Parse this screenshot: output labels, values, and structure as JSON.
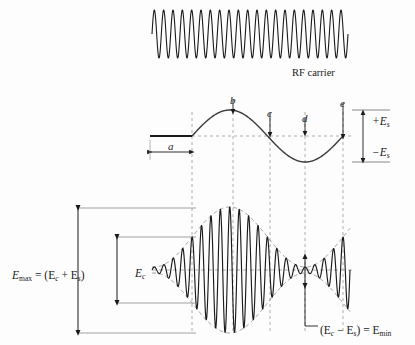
{
  "figure": {
    "title_implied": "AM modulation envelope diagram",
    "background_color": "#fdfdfd",
    "ink_color": "#1a1a1a",
    "guide_color": "#9a9a9a",
    "envelope_color": "#8c8c8c"
  },
  "carrier_panel": {
    "label": "RF carrier",
    "label_x": 292,
    "label_y": 68,
    "wave": {
      "x_start": 152,
      "x_end": 348,
      "y_center": 34,
      "amplitude": 24,
      "cycles": 21
    }
  },
  "modulating_panel": {
    "baseline_y": 136,
    "flat_x_start": 150,
    "flat_x_end": 192,
    "sine_x_start": 192,
    "sine_x_end": 343,
    "amplitude": 26,
    "cycles": 1,
    "dim_a": {
      "label": "a",
      "x_start": 150,
      "x_end": 192,
      "y": 152
    },
    "markers": [
      {
        "label": "b",
        "x": 233,
        "label_y": 95,
        "arrow_top": 100,
        "arrow_bottom": 112
      },
      {
        "label": "c",
        "x": 270,
        "label_y": 108,
        "arrow_top": 113,
        "arrow_bottom": 135
      },
      {
        "label": "d",
        "x": 305,
        "label_y": 113,
        "arrow_top": 118,
        "arrow_bottom": 134
      },
      {
        "label": "e",
        "x": 343,
        "label_y": 98,
        "arrow_top": 103,
        "arrow_bottom": 137
      }
    ],
    "amplitude_labels": [
      {
        "text": "+E",
        "sub": "s",
        "x": 372,
        "y": 116,
        "arrow_x": 363,
        "arrow_from": 136,
        "arrow_to": 112
      },
      {
        "text": "−E",
        "sub": "s",
        "x": 372,
        "y": 147,
        "arrow_x": 363,
        "arrow_from": 136,
        "arrow_to": 161
      }
    ],
    "level_ticks": [
      {
        "y": 110,
        "x_start": 352,
        "x_end": 390
      },
      {
        "y": 162,
        "x_start": 352,
        "x_end": 390
      }
    ]
  },
  "am_panel": {
    "x_start": 152,
    "x_end": 350,
    "center_y": 270,
    "carrier_amplitude": 33,
    "modulation_amplitude": 30,
    "carrier_cycles": 21,
    "envelope_phase_x_start": 192,
    "dimensions": [
      {
        "name": "E-max",
        "text": "E",
        "sub": "max",
        "suffix": " = (E",
        "sub2": "c",
        "suffix2": " + E",
        "sub3": "s",
        "suffix3": ")",
        "label_x": 12,
        "label_y": 270,
        "arrow_x": 78,
        "y_top": 208,
        "y_bottom": 333,
        "rule_top": {
          "x_start": 78,
          "x_end": 196,
          "y": 208
        },
        "rule_bottom": {
          "x_start": 78,
          "x_end": 196,
          "y": 333
        }
      },
      {
        "name": "E-c",
        "text": "E",
        "sub": "c",
        "label_x": 117,
        "label_y": 268,
        "arrow_x": 117,
        "y_top": 237,
        "y_bottom": 303,
        "rule_top": {
          "x_start": 117,
          "x_end": 196,
          "y": 237
        },
        "rule_bottom": {
          "x_start": 117,
          "x_end": 196,
          "y": 303
        }
      }
    ],
    "emin": {
      "arrow_x": 305,
      "y_top": 256,
      "y_bottom": 286,
      "leader_down_to": 326,
      "leader_x_end": 318,
      "label": "(E",
      "sub": "c",
      "mid": " − E",
      "sub2": "s",
      "tail": ") = E",
      "sub3": "min",
      "label_x": 320,
      "label_y": 325
    }
  },
  "guides": {
    "vertical_dashed_x": [
      192,
      233,
      270,
      305,
      343
    ],
    "y_top": 112,
    "y_bottom": 333,
    "baseline_dashed": {
      "y": 136,
      "x_start": 192,
      "x_end": 352
    },
    "am_center_dashed": {
      "y": 270,
      "x_start": 152,
      "x_end": 352
    }
  }
}
